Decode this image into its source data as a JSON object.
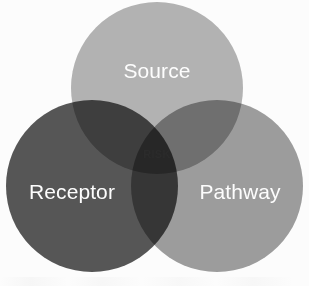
{
  "diagram": {
    "type": "venn",
    "background_color": "#ffffff",
    "canvas": {
      "width": 309,
      "height": 286
    },
    "sets": [
      {
        "id": "source",
        "label": "Source",
        "color": "#b5b5b5",
        "text_color": "#ffffff",
        "cx": 157,
        "cy": 88,
        "r": 86,
        "label_x": 157,
        "label_y": 72,
        "label_font_size": 21
      },
      {
        "id": "receptor",
        "label": "Receptor",
        "color": "#575757",
        "text_color": "#ffffff",
        "cx": 92,
        "cy": 186,
        "r": 86,
        "label_x": 72,
        "label_y": 193,
        "label_font_size": 21
      },
      {
        "id": "pathway",
        "label": "Pathway",
        "color": "#9e9e9e",
        "text_color": "#ffffff",
        "cx": 217,
        "cy": 186,
        "r": 86,
        "label_x": 240,
        "label_y": 193,
        "label_font_size": 21
      }
    ],
    "intersection": {
      "id": "risk",
      "label": "RISK",
      "text_color": "#2b2b2b",
      "label_x": 157,
      "label_y": 155,
      "label_font_size": 11,
      "description": "central three-way overlap of Source, Receptor and Pathway"
    }
  }
}
